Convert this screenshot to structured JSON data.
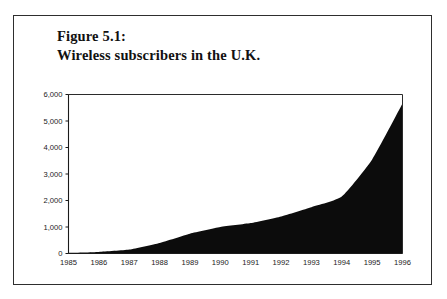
{
  "figure": {
    "title_line1": "Figure 5.1:",
    "title_line2": "Wireless subscribers in the U.K.",
    "border_color": "#2e2e2e",
    "background_color": "#ffffff"
  },
  "chart_data": {
    "type": "area",
    "title": "Wireless subscribers in the U.K.",
    "subtitle": "Figure 5.1:",
    "xlabel": "",
    "ylabel": "",
    "x": [
      1985,
      1986,
      1987,
      1988,
      1989,
      1990,
      1991,
      1992,
      1993,
      1994,
      1995,
      1996
    ],
    "categories": [
      "1985",
      "1986",
      "1987",
      "1988",
      "1989",
      "1990",
      "1991",
      "1992",
      "1993",
      "1994",
      "1995",
      "1996"
    ],
    "values": [
      25,
      60,
      150,
      400,
      750,
      1000,
      1150,
      1400,
      1750,
      2150,
      3550,
      5660
    ],
    "series": [
      {
        "name": "Wireless subscribers",
        "values": [
          25,
          60,
          150,
          400,
          750,
          1000,
          1150,
          1400,
          1750,
          2150,
          3550,
          5660
        ]
      }
    ],
    "ylim": [
      0,
      6000
    ],
    "xlim": [
      1985,
      1996
    ],
    "yticks": [
      0,
      1000,
      2000,
      3000,
      4000,
      5000,
      6000
    ],
    "ytick_labels": [
      "0",
      "1,000",
      "2,000",
      "3,000",
      "4,000",
      "5,000",
      "6,000"
    ],
    "xtick_labels": [
      "1985",
      "1986",
      "1987",
      "1988",
      "1989",
      "1990",
      "1991",
      "1992",
      "1993",
      "1994",
      "1995",
      "1996"
    ],
    "grid": false,
    "legend": false,
    "legend_position": "none",
    "fill_color": "#0c0c0c",
    "axis_color": "#1a1a1a"
  }
}
